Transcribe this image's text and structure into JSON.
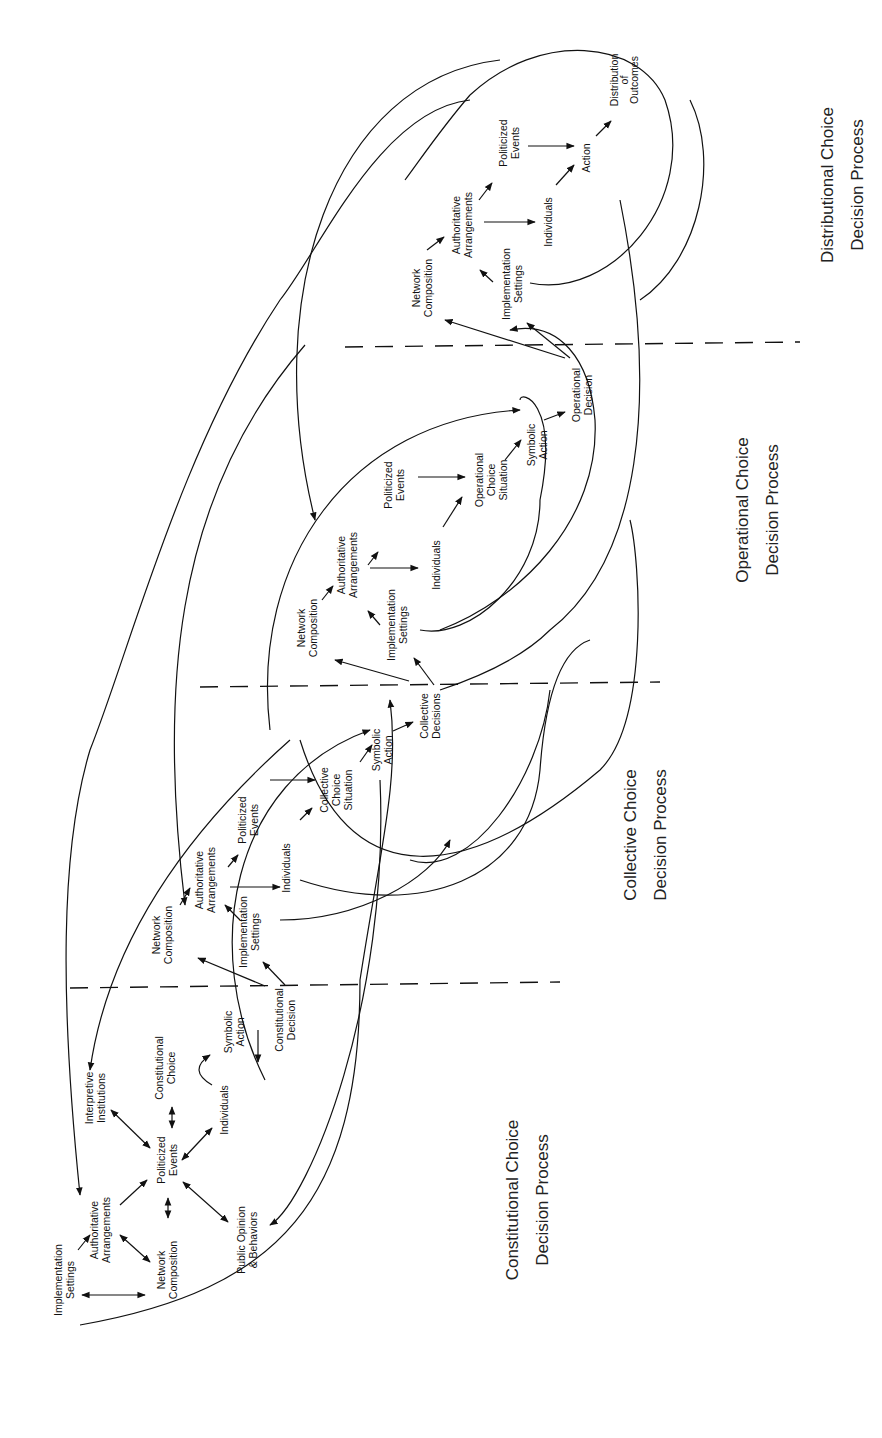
{
  "diagram": {
    "orientation": "rotated-90-ccw",
    "sections": [
      {
        "id": "constitutional",
        "title_line1": "Constitutional Choice",
        "title_line2": "Decision Process"
      },
      {
        "id": "collective",
        "title_line1": "Collective Choice",
        "title_line2": "Decision Process"
      },
      {
        "id": "operational",
        "title_line1": "Operational Choice",
        "title_line2": "Decision Process"
      },
      {
        "id": "distributional",
        "title_line1": "Distributional Choice",
        "title_line2": "Decision Process"
      }
    ],
    "constitutional_nodes": {
      "implementation_settings": [
        "Implementation",
        "Settings"
      ],
      "authoritative_arrangements": [
        "Authoritative",
        "Arrangements"
      ],
      "network_composition": [
        "Network",
        "Composition"
      ],
      "politicized_events": [
        "Politicized",
        "Events"
      ],
      "interpretive_institutions": [
        "Interpretive",
        "Institutions"
      ],
      "constitutional_choice": [
        "Constitutional",
        "Choice"
      ],
      "individuals": [
        "Individuals"
      ],
      "public_opinion": [
        "Public Opinion",
        "& Behaviors"
      ],
      "symbolic_action": [
        "Symbolic",
        "Action"
      ],
      "constitutional_decision": [
        "Constitutional",
        "Decision"
      ]
    },
    "collective_nodes": {
      "network_composition": [
        "Network",
        "Composition"
      ],
      "authoritative_arrangements": [
        "Authoritative",
        "Arrangements"
      ],
      "implementation_settings": [
        "Implementation",
        "Settings"
      ],
      "politicized_events": [
        "Politicized",
        "Events"
      ],
      "individuals": [
        "Individuals"
      ],
      "choice_situation": [
        "Collective",
        "Choice",
        "Situation"
      ],
      "symbolic_action": [
        "Symbolic",
        "Action"
      ],
      "decision": [
        "Collective",
        "Decisions"
      ]
    },
    "operational_nodes": {
      "network_composition": [
        "Network",
        "Composition"
      ],
      "authoritative_arrangements": [
        "Authoritative",
        "Arrangements"
      ],
      "implementation_settings": [
        "Implementation",
        "Settings"
      ],
      "politicized_events": [
        "Politicized",
        "Events"
      ],
      "individuals": [
        "Individuals"
      ],
      "choice_situation": [
        "Operational",
        "Choice",
        "Situation"
      ],
      "symbolic_action": [
        "Symbolic",
        "Action"
      ],
      "decision": [
        "Operational",
        "Decision"
      ]
    },
    "distributional_nodes": {
      "network_composition": [
        "Network",
        "Composition"
      ],
      "authoritative_arrangements": [
        "Authoritative",
        "Arrangements"
      ],
      "implementation_settings": [
        "Implementation",
        "Settings"
      ],
      "politicized_events": [
        "Politicized",
        "Events"
      ],
      "individuals": [
        "Individuals"
      ],
      "action": [
        "Action"
      ],
      "outcomes": [
        "Distribution",
        "of",
        "Outcomes"
      ]
    }
  }
}
